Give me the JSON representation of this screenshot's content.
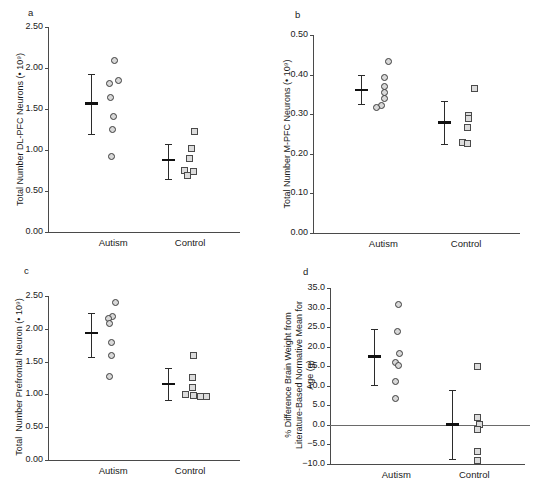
{
  "figure": {
    "panels": [
      "a",
      "b",
      "c",
      "d"
    ],
    "groups": [
      "Autism",
      "Control"
    ],
    "marker_autism": "open-circle",
    "marker_control": "open-square",
    "colors": {
      "axis": "#4a4a4a",
      "marker_outline": "#3c3c3c",
      "marker_fill": "#d8d8d8",
      "errorbar": "#2b2b2b",
      "zero_line": "#6a6a6a"
    }
  },
  "chart_data": [
    {
      "panel": "a",
      "type": "scatter",
      "title": "",
      "ylabel": "Total Number DL-PFC Neurons (• 10⁹)",
      "xlabel": "",
      "categories": [
        "Autism",
        "Control"
      ],
      "yticks": [
        "0.00",
        "0.50",
        "1.00",
        "1.50",
        "2.00",
        "2.50"
      ],
      "ylim": [
        0.0,
        2.5
      ],
      "grid": false,
      "legend": "none",
      "series": [
        {
          "name": "Autism",
          "marker": "circle",
          "values": [
            2.1,
            1.82,
            1.85,
            1.65,
            1.41,
            1.26,
            0.93
          ],
          "mean": 1.57,
          "err_low": 1.2,
          "err_high": 1.93
        },
        {
          "name": "Control",
          "marker": "square",
          "values": [
            1.23,
            1.02,
            0.9,
            0.76,
            0.75,
            0.69
          ],
          "mean": 0.88,
          "err_low": 0.65,
          "err_high": 1.07
        }
      ]
    },
    {
      "panel": "b",
      "type": "scatter",
      "title": "",
      "ylabel": "Total Number M-PFC Neurons (• 10⁹)",
      "xlabel": "",
      "categories": [
        "Autism",
        "Control"
      ],
      "yticks": [
        "0.00",
        "0.10",
        "0.20",
        "0.30",
        "0.40",
        "0.50"
      ],
      "ylim": [
        0.0,
        0.5
      ],
      "grid": false,
      "legend": "none",
      "series": [
        {
          "name": "Autism",
          "marker": "circle",
          "values": [
            0.435,
            0.395,
            0.37,
            0.355,
            0.34,
            0.323,
            0.317
          ],
          "mean": 0.362,
          "err_low": 0.325,
          "err_high": 0.4
        },
        {
          "name": "Control",
          "marker": "square",
          "values": [
            0.367,
            0.298,
            0.29,
            0.267,
            0.23,
            0.228
          ],
          "mean": 0.28,
          "err_low": 0.225,
          "err_high": 0.333
        }
      ]
    },
    {
      "panel": "c",
      "type": "scatter",
      "title": "",
      "ylabel": "Total  Number Prefrontal Neuron (• 10⁹)",
      "xlabel": "",
      "categories": [
        "Autism",
        "Control"
      ],
      "yticks": [
        "0.00",
        "0.50",
        "1.00",
        "1.50",
        "2.00",
        "2.50"
      ],
      "ylim": [
        0.0,
        2.5
      ],
      "grid": false,
      "legend": "none",
      "series": [
        {
          "name": "Autism",
          "marker": "circle",
          "values": [
            2.41,
            2.2,
            2.16,
            2.09,
            1.8,
            1.6,
            1.28
          ],
          "mean": 1.94,
          "err_low": 1.57,
          "err_high": 2.24
        },
        {
          "name": "Control",
          "marker": "square",
          "values": [
            1.6,
            1.27,
            1.12,
            1.0,
            0.99,
            0.98,
            0.97
          ],
          "mean": 1.16,
          "err_low": 0.91,
          "err_high": 1.4
        }
      ]
    },
    {
      "panel": "d",
      "type": "scatter",
      "title": "",
      "ylabel": "% Difference Brain Weight from\nLiterature-Based Normative Mean for\nAge (g)",
      "xlabel": "",
      "categories": [
        "Autism",
        "Control"
      ],
      "yticks": [
        "-10.0",
        "-5.0",
        "0.0",
        "5.0",
        "10.0",
        "15.0",
        "20.0",
        "25.0",
        "30.0",
        "35.0"
      ],
      "ylim": [
        -10.0,
        35.0
      ],
      "zero_line": 0.0,
      "grid": false,
      "legend": "none",
      "series": [
        {
          "name": "Autism",
          "marker": "circle",
          "values": [
            30.8,
            24.1,
            18.3,
            16.0,
            15.3,
            11.1,
            7.0
          ],
          "mean": 17.6,
          "err_low": 10.1,
          "err_high": 24.5
        },
        {
          "name": "Control",
          "marker": "square",
          "values": [
            15.0,
            2.1,
            0.3,
            -1.0,
            -6.8,
            -9.0
          ],
          "mean": 0.2,
          "err_low": -8.8,
          "err_high": 8.8
        }
      ]
    }
  ]
}
